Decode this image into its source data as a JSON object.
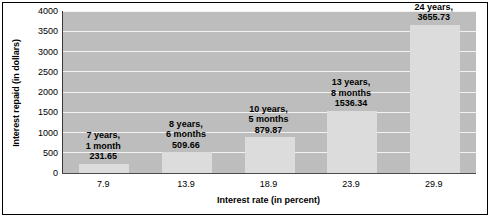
{
  "chart_data": {
    "type": "bar",
    "title": "",
    "xlabel": "Interest rate (in percent)",
    "ylabel": "Interest repaid (in dollars)",
    "categories": [
      "7.9",
      "13.9",
      "18.9",
      "23.9",
      "29.9"
    ],
    "values": [
      231.65,
      509.66,
      879.87,
      1536.34,
      3655.73
    ],
    "ylim": [
      0,
      4000
    ],
    "yticks": [
      "0",
      "500",
      "1000",
      "1500",
      "2000",
      "2500",
      "3000",
      "3500",
      "4000"
    ],
    "ytick_values": [
      0,
      500,
      1000,
      1500,
      2000,
      2500,
      3000,
      3500,
      4000
    ],
    "grid": true,
    "legend": null,
    "bar_color": "#dcdcdc",
    "plot_background": "#bdbdbd",
    "gridline_color": "#f2f2f2",
    "annotations": [
      {
        "line1": "7 years,",
        "line2": "1 month",
        "line3": "231.65"
      },
      {
        "line1": "8 years,",
        "line2": "6 months",
        "line3": "509.66"
      },
      {
        "line1": "10 years,",
        "line2": "5 months",
        "line3": "879.87"
      },
      {
        "line1": "13 years,",
        "line2": "8 months",
        "line3": "1536.34"
      },
      {
        "line1": "24 years,",
        "line2": "3655.73",
        "line3": ""
      }
    ]
  }
}
